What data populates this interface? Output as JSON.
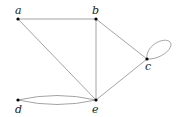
{
  "graph": {
    "nodes": [
      {
        "id": "a",
        "label": "a",
        "x": 18,
        "y": 19,
        "lx": 15,
        "ly": 14
      },
      {
        "id": "b",
        "label": "b",
        "x": 96,
        "y": 19,
        "lx": 92,
        "ly": 14
      },
      {
        "id": "c",
        "label": "c",
        "x": 147,
        "y": 59,
        "lx": 145,
        "ly": 70
      },
      {
        "id": "d",
        "label": "d",
        "x": 18,
        "y": 100,
        "lx": 15,
        "ly": 113
      },
      {
        "id": "e",
        "label": "e",
        "x": 96,
        "y": 100,
        "lx": 92,
        "ly": 113
      }
    ],
    "edges": [
      {
        "from": "a",
        "to": "b",
        "type": "straight"
      },
      {
        "from": "a",
        "to": "e",
        "type": "straight"
      },
      {
        "from": "b",
        "to": "e",
        "type": "straight"
      },
      {
        "from": "b",
        "to": "c",
        "type": "straight"
      },
      {
        "from": "c",
        "to": "e",
        "type": "straight"
      },
      {
        "from": "d",
        "to": "e",
        "type": "curved-upper"
      },
      {
        "from": "d",
        "to": "e",
        "type": "curved-lower"
      },
      {
        "from": "c",
        "to": "c",
        "type": "loop"
      }
    ],
    "colors": {
      "edge": "#9a9a9a",
      "node": "#000000",
      "label": "#222222"
    }
  }
}
